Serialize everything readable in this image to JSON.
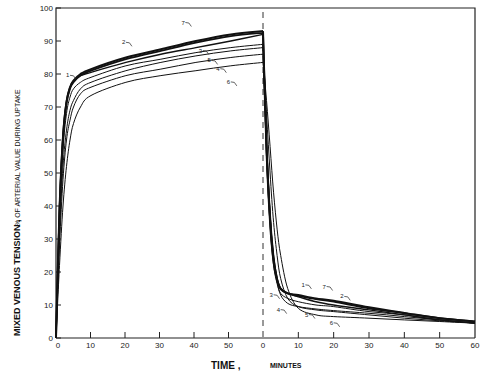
{
  "chart_data": {
    "type": "line",
    "title": "",
    "ylabel_main": "MIXED VENOUS TENSION ,",
    "ylabel_sub": "% OF ARTERIAL VALUE DURING UPTAKE",
    "xlabel_main": "TIME ,",
    "xlabel_sub": "MINUTES",
    "ylim": [
      0,
      100
    ],
    "yticks": [
      0,
      10,
      20,
      30,
      40,
      50,
      60,
      70,
      80,
      90,
      100
    ],
    "panels": [
      {
        "name": "uptake",
        "xlim": [
          0,
          60
        ],
        "xticks": [
          0,
          10,
          20,
          30,
          40,
          50
        ]
      },
      {
        "name": "elimination",
        "xlim": [
          0,
          60
        ],
        "xticks": [
          0,
          10,
          20,
          30,
          40,
          50,
          60
        ]
      }
    ],
    "divider": "dashed vertical line at end of uptake (t=0 of elimination)",
    "grid": false,
    "legend": "inline numeric labels 1-7 on curves",
    "series": [
      {
        "name": "1",
        "uptake": {
          "x": [
            0,
            1,
            2,
            3,
            4,
            5,
            7,
            10,
            20,
            30,
            40,
            50,
            60
          ],
          "y": [
            0,
            40,
            62,
            72,
            76,
            78,
            79.5,
            80.5,
            83.5,
            86,
            88,
            90,
            92
          ]
        },
        "elimination": {
          "x": [
            0,
            1,
            2,
            3,
            4,
            5,
            7,
            10,
            15,
            20,
            30,
            40,
            50,
            60
          ],
          "y": [
            92,
            60,
            38,
            25,
            18,
            15,
            13.5,
            12.5,
            11,
            10,
            8.5,
            7,
            5.5,
            4.5
          ]
        }
      },
      {
        "name": "2",
        "uptake": {
          "x": [
            0,
            1,
            2,
            3,
            4,
            5,
            7,
            10,
            20,
            30,
            40,
            50,
            60
          ],
          "y": [
            0,
            38,
            60,
            71,
            75.5,
            77.5,
            79.5,
            81,
            84.5,
            87,
            89.5,
            91.5,
            92.5
          ]
        },
        "elimination": {
          "x": [
            0,
            1,
            2,
            3,
            4,
            5,
            7,
            10,
            15,
            20,
            30,
            40,
            50,
            60
          ],
          "y": [
            92.5,
            58,
            36,
            24,
            18,
            15,
            13.5,
            12.8,
            11.8,
            11,
            9,
            7.5,
            6,
            5
          ]
        }
      },
      {
        "name": "3",
        "uptake": {
          "x": [
            0,
            1,
            2,
            3,
            4,
            5,
            7,
            10,
            20,
            30,
            40,
            50,
            60
          ],
          "y": [
            0,
            35,
            57,
            68,
            73,
            75.5,
            77.5,
            79,
            82.5,
            84.5,
            86.5,
            88,
            89
          ]
        },
        "elimination": {
          "x": [
            0,
            1,
            2,
            3,
            4,
            5,
            7,
            10,
            15,
            20,
            30,
            40,
            50,
            60
          ],
          "y": [
            89,
            55,
            34,
            22,
            16.5,
            13.5,
            12,
            11,
            10,
            9.5,
            8,
            7,
            5.5,
            4.5
          ]
        }
      },
      {
        "name": "4",
        "uptake": {
          "x": [
            0,
            1,
            2,
            3,
            4,
            5,
            7,
            10,
            20,
            30,
            40,
            50,
            60
          ],
          "y": [
            0,
            28,
            48,
            60,
            66,
            70,
            74,
            76,
            79.5,
            81.5,
            83.5,
            85,
            86
          ]
        },
        "elimination": {
          "x": [
            0,
            1,
            2,
            3,
            4,
            5,
            7,
            10,
            15,
            20,
            30,
            40,
            50,
            60
          ],
          "y": [
            86,
            60,
            38,
            24,
            17,
            13,
            10.5,
            9.5,
            8.8,
            8.3,
            7.5,
            6.5,
            5.5,
            4.5
          ]
        }
      },
      {
        "name": "5",
        "uptake": {
          "x": [
            0,
            1,
            2,
            3,
            4,
            5,
            7,
            10,
            20,
            30,
            40,
            50,
            60
          ],
          "y": [
            0,
            31,
            52,
            63,
            69,
            72,
            75.5,
            77.5,
            81,
            83.5,
            85.5,
            87,
            88
          ]
        },
        "elimination": {
          "x": [
            0,
            1,
            2,
            3,
            4,
            5,
            7,
            10,
            15,
            20,
            30,
            40,
            50,
            60
          ],
          "y": [
            88,
            68,
            50,
            35,
            25,
            18,
            12,
            9.5,
            8.5,
            8,
            7,
            6,
            5.2,
            4.5
          ]
        }
      },
      {
        "name": "6",
        "uptake": {
          "x": [
            0,
            1,
            2,
            3,
            4,
            5,
            7,
            10,
            20,
            30,
            40,
            50,
            60
          ],
          "y": [
            0,
            22,
            40,
            52,
            60,
            65,
            70,
            73.5,
            77.5,
            79.5,
            81,
            82.5,
            83.5
          ]
        },
        "elimination": {
          "x": [
            0,
            1,
            2,
            3,
            4,
            5,
            7,
            10,
            15,
            20,
            30,
            40,
            50,
            60
          ],
          "y": [
            83.5,
            72,
            58,
            44,
            33,
            25,
            15,
            9,
            7,
            6.5,
            6,
            5.5,
            5,
            4.5
          ]
        }
      },
      {
        "name": "7",
        "uptake": {
          "x": [
            0,
            1,
            2,
            3,
            4,
            5,
            7,
            10,
            20,
            30,
            40,
            50,
            60
          ],
          "y": [
            0,
            39,
            61,
            71.5,
            76,
            78,
            80,
            81.5,
            85,
            87.5,
            90,
            92,
            93
          ]
        },
        "elimination": {
          "x": [
            0,
            1,
            2,
            3,
            4,
            5,
            7,
            10,
            15,
            20,
            30,
            40,
            50,
            60
          ],
          "y": [
            93,
            57,
            35,
            23,
            17.5,
            14.8,
            13.5,
            13,
            12,
            11.3,
            9.3,
            7.6,
            6,
            5
          ]
        }
      }
    ],
    "curve_label_positions": {
      "uptake": [
        {
          "label": "1",
          "x": 4,
          "y": 79
        },
        {
          "label": "2",
          "x": 20,
          "y": 89
        },
        {
          "label": "7",
          "x": 37,
          "y": 95
        },
        {
          "label": "3",
          "x": 42,
          "y": 86.5
        },
        {
          "label": "5",
          "x": 44.5,
          "y": 83.5
        },
        {
          "label": "4",
          "x": 47,
          "y": 81
        },
        {
          "label": "6",
          "x": 50,
          "y": 77
        }
      ],
      "elimination": [
        {
          "label": "3",
          "x": 3,
          "y": 12.5
        },
        {
          "label": "4",
          "x": 5,
          "y": 8
        },
        {
          "label": "1",
          "x": 12,
          "y": 15.5
        },
        {
          "label": "7",
          "x": 18,
          "y": 15
        },
        {
          "label": "2",
          "x": 23,
          "y": 12
        },
        {
          "label": "5",
          "x": 13,
          "y": 6.5
        },
        {
          "label": "6",
          "x": 20,
          "y": 4
        }
      ]
    }
  }
}
